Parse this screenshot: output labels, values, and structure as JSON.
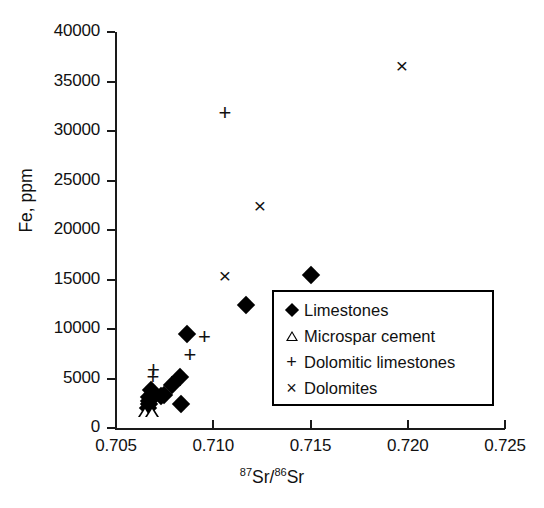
{
  "chart_data": {
    "type": "scatter",
    "title": "",
    "xlabel": "87Sr/86Sr",
    "ylabel": "Fe, ppm",
    "xlim": [
      0.705,
      0.725
    ],
    "ylim": [
      0,
      40000
    ],
    "xticks": [
      "0.705",
      "0.710",
      "0.715",
      "0.720",
      "0.725"
    ],
    "xtick_values": [
      0.705,
      0.71,
      0.715,
      0.72,
      0.725
    ],
    "yticks": [
      "0",
      "5000",
      "10000",
      "15000",
      "20000",
      "25000",
      "30000",
      "35000",
      "40000"
    ],
    "ytick_values": [
      0,
      5000,
      10000,
      15000,
      20000,
      25000,
      30000,
      35000,
      40000
    ],
    "grid": false,
    "legend_position": "center-right",
    "series": [
      {
        "name": "Limestones",
        "marker": "filled-diamond",
        "points": [
          [
            0.70665,
            2050
          ],
          [
            0.70668,
            2400
          ],
          [
            0.7067,
            2750
          ],
          [
            0.70672,
            3150
          ],
          [
            0.70678,
            3800
          ],
          [
            0.7073,
            3200
          ],
          [
            0.70748,
            3300
          ],
          [
            0.7079,
            4300
          ],
          [
            0.7083,
            5150
          ],
          [
            0.70835,
            2400
          ],
          [
            0.70865,
            9450
          ],
          [
            0.7117,
            12450
          ],
          [
            0.715,
            15500
          ]
        ]
      },
      {
        "name": "Microspar cement",
        "marker": "open-triangle",
        "points": [
          [
            0.7065,
            500
          ],
          [
            0.70685,
            550
          ]
        ]
      },
      {
        "name": "Dolomitic limestones",
        "marker": "plus",
        "points": [
          [
            0.7069,
            5200
          ],
          [
            0.70693,
            5900
          ],
          [
            0.7088,
            7400
          ],
          [
            0.70955,
            9150
          ],
          [
            0.7106,
            31800
          ]
        ]
      },
      {
        "name": "Dolomites",
        "marker": "cross",
        "points": [
          [
            0.7106,
            15500
          ],
          [
            0.7124,
            22500
          ],
          [
            0.7197,
            36650
          ]
        ]
      }
    ]
  },
  "axes": {
    "y_title": "Fe, ppm",
    "x_title_parts": {
      "sup1": "87",
      "mid1": "Sr/",
      "sup2": "86",
      "mid2": "Sr"
    }
  },
  "legend": {
    "items": [
      {
        "symbol": "filled-diamond-icon",
        "label": "Limestones"
      },
      {
        "symbol": "open-triangle-icon",
        "label": "Microspar cement"
      },
      {
        "symbol": "plus-icon",
        "label": "Dolomitic limestones"
      },
      {
        "symbol": "cross-icon",
        "label": "Dolomites"
      }
    ]
  },
  "colors": {
    "marker": "#000000",
    "axis": "#1a1a1a",
    "background": "#ffffff",
    "text": "#111111"
  },
  "glyphs": {
    "plus": "+",
    "cross": "×"
  }
}
